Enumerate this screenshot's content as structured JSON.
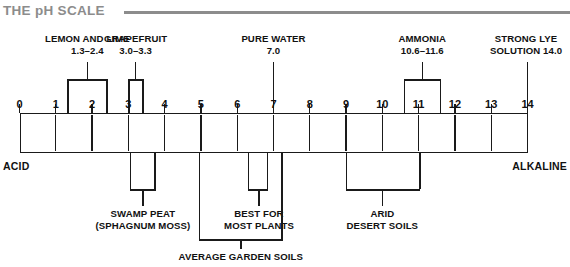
{
  "header": {
    "title": "THE pH SCALE",
    "rule_color": "#8c8c8c"
  },
  "scale": {
    "min": 0,
    "max": 14,
    "neutral": 7,
    "tick_labels": [
      "0",
      "1",
      "2",
      "3",
      "4",
      "5",
      "6",
      "7",
      "8",
      "9",
      "10",
      "11",
      "12",
      "13",
      "14"
    ],
    "acid_label": "ACID",
    "alkaline_label": "ALKALINE",
    "acid_fill": "#ffffff",
    "alkaline_fill": "#e9e9e9",
    "outline_color": "#1a1a1a"
  },
  "annotations_above": [
    {
      "name": "lemon-and-lime",
      "line1": "LEMON AND LIME",
      "line2": "1.3–2.4",
      "range_start": 1.32,
      "range_end": 2.42,
      "stem_at": 1.87,
      "type": "bracket"
    },
    {
      "name": "grapefruit",
      "line1": "GRAPEFRUIT",
      "line2": "3.0–3.3",
      "range_start": 3.0,
      "range_end": 3.42,
      "stem_at": 3.2,
      "type": "bracket"
    },
    {
      "name": "pure-water",
      "line1": "PURE WATER",
      "line2": "7.0",
      "range_start": 7.0,
      "range_end": 7.0,
      "stem_at": 7.0,
      "type": "pointer"
    },
    {
      "name": "ammonia",
      "line1": "AMMONIA",
      "line2": "10.6–11.6",
      "range_start": 10.6,
      "range_end": 11.62,
      "stem_at": 11.1,
      "type": "bracket"
    },
    {
      "name": "strong-lye-solution",
      "line1": "STRONG LYE",
      "line2": "SOLUTION 14.0",
      "range_start": 14.0,
      "range_end": 14.0,
      "stem_at": 14.0,
      "type": "pointer"
    }
  ],
  "annotations_below": [
    {
      "name": "swamp-peat",
      "line1": "SWAMP PEAT",
      "line2": "(SPHAGNUM MOSS)",
      "range_start": 3.05,
      "range_end": 3.75,
      "stem_at": 3.4,
      "tier": 1
    },
    {
      "name": "best-for-most-plants",
      "line1": "BEST FOR",
      "line2": "MOST PLANTS",
      "range_start": 6.3,
      "range_end": 6.85,
      "stem_at": 6.6,
      "tier": 1
    },
    {
      "name": "arid-desert-soils",
      "line1": "ARID",
      "line2": "DESERT SOILS",
      "range_start": 9.0,
      "range_end": 11.05,
      "stem_at": 10.0,
      "tier": 1
    },
    {
      "name": "average-garden-soils",
      "line1": "AVERAGE GARDEN SOILS",
      "line2": "",
      "range_start": 4.95,
      "range_end": 7.25,
      "stem_at": 6.1,
      "tier": 2
    }
  ]
}
